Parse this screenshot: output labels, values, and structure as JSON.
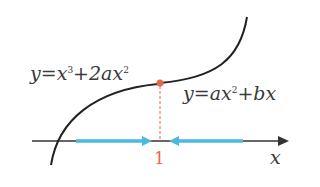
{
  "diagram": {
    "curve1_label": {
      "prefix": "y=x",
      "exp1": "3",
      "mid": "+2ax",
      "exp2": "2"
    },
    "curve2_label": {
      "prefix": "y=ax",
      "exp1": "2",
      "mid": "+bx"
    },
    "x_axis_label": "x",
    "tick_label": "1",
    "colors": {
      "curve": "#222222",
      "point": "#e8664a",
      "dashed": "#e8664a",
      "arrows": "#4bb8e0",
      "axis": "#333333"
    }
  }
}
